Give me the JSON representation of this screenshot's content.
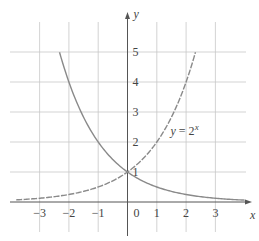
{
  "chart_data": {
    "type": "line",
    "title": "",
    "xlabel": "x",
    "ylabel": "y",
    "xlim": [
      -3.8,
      4.2
    ],
    "ylim": [
      0,
      5.6
    ],
    "grid": true,
    "x_ticks": [
      "-3",
      "-2",
      "-1",
      "0",
      "1",
      "2",
      "3"
    ],
    "y_ticks": [
      "1",
      "2",
      "3",
      "4",
      "5"
    ],
    "series": [
      {
        "name": "y = (1/2)^x",
        "style": "solid",
        "x": [
          -2.32,
          -2,
          -1,
          0,
          1,
          2,
          3,
          4
        ],
        "values": [
          5,
          4,
          2,
          1,
          0.5,
          0.25,
          0.125,
          0.0625
        ]
      },
      {
        "name": "y = 2^x",
        "style": "dashed",
        "x": [
          -3.8,
          -3,
          -2,
          -1,
          0,
          1,
          2,
          2.32
        ],
        "values": [
          0.07,
          0.125,
          0.25,
          0.5,
          1,
          2,
          4,
          5
        ]
      }
    ],
    "annotations": [
      {
        "text_base": "y = 2",
        "text_sup": "x",
        "x": 1.4,
        "y": 2.5
      }
    ]
  }
}
